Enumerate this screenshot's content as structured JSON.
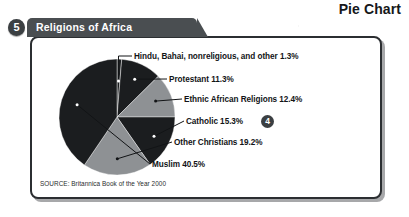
{
  "page": {
    "title": "Pie Chart"
  },
  "figure": {
    "number": "5",
    "tab_label": "Religions of Africa",
    "source": "SOURCE: Britannica Book of the Year 2000",
    "callout_badge": "4"
  },
  "colors": {
    "tab_background": "#4a4e51",
    "badge_background": "#3b3f42",
    "panel_border": "#2b2e31",
    "slice_dark": "#1b1d1f",
    "slice_gray": "#8e9194",
    "text": "#121416",
    "page_background": "#ffffff"
  },
  "chart_data": {
    "type": "pie",
    "title": "Religions of Africa",
    "subtitle": "",
    "xlabel": "",
    "ylabel": "",
    "units": "percent",
    "legend_position": "right-callouts",
    "grid": false,
    "start_angle_deg": 0,
    "direction": "clockwise",
    "total": 100.0,
    "categories": [
      "Hindu, Bahai, nonreligious, and other",
      "Protestant",
      "Ethnic African Religions",
      "Catholic",
      "Other Christians",
      "Muslim"
    ],
    "values": [
      1.3,
      11.3,
      12.4,
      15.3,
      19.2,
      40.5
    ],
    "slice_colors": [
      "#1b1d1f",
      "#1b1d1f",
      "#8e9194",
      "#1b1d1f",
      "#8e9194",
      "#1b1d1f"
    ],
    "labels": [
      "Hindu, Bahai, nonreligious, and other 1.3%",
      "Protestant 11.3%",
      "Ethnic African Religions 12.4%",
      "Catholic 15.3%",
      "Other Christians 19.2%",
      "Muslim 40.5%"
    ]
  }
}
